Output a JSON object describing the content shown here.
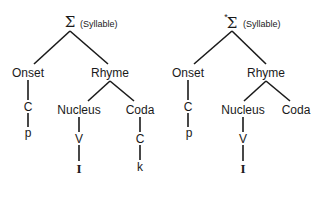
{
  "diagram": {
    "type": "syllable-structure-trees",
    "trees": [
      {
        "id": "left",
        "root": {
          "symbol": "Σ",
          "prefix": "",
          "label": "(Syllable)"
        },
        "onset": {
          "label": "Onset",
          "slot": "C",
          "segment": "p"
        },
        "rhyme": {
          "label": "Rhyme",
          "nucleus": {
            "label": "Nucleus",
            "slot": "V",
            "segment": "I"
          },
          "coda": {
            "label": "Coda",
            "slot": "C",
            "segment": "k"
          }
        }
      },
      {
        "id": "right",
        "root": {
          "symbol": "Σ",
          "prefix": "*",
          "label": "(Syllable)"
        },
        "onset": {
          "label": "Onset",
          "slot": "C",
          "segment": "p"
        },
        "rhyme": {
          "label": "Rhyme",
          "nucleus": {
            "label": "Nucleus",
            "slot": "V",
            "segment": "I"
          },
          "coda": {
            "label": "Coda",
            "slot": null,
            "segment": null
          }
        }
      }
    ]
  }
}
